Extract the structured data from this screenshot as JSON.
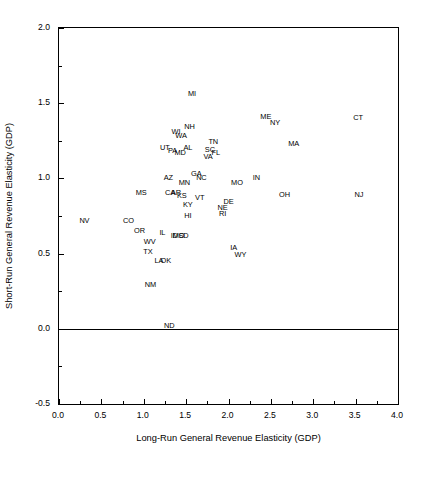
{
  "chart_data": {
    "type": "scatter",
    "title": "",
    "xlabel": "Long-Run General Revenue Elasticity (GDP)",
    "ylabel": "Short-Run General Revenue Elasticity (GDP)",
    "xlim": [
      0.0,
      4.0
    ],
    "ylim": [
      -0.5,
      2.0
    ],
    "xticks": [
      "0.0",
      "0.5",
      "1.0",
      "1.5",
      "2.0",
      "2.5",
      "3.0",
      "3.5",
      "4.0"
    ],
    "xtick_values": [
      0.0,
      0.5,
      1.0,
      1.5,
      2.0,
      2.5,
      3.0,
      3.5,
      4.0
    ],
    "yticks": [
      "-0.5",
      "0.0",
      "0.5",
      "1.0",
      "1.5",
      "2.0"
    ],
    "ytick_values": [
      -0.5,
      0.0,
      0.5,
      1.0,
      1.5,
      2.0
    ],
    "xminor_step": 0.25,
    "yminor_step": 0.25,
    "grid": false,
    "legend": false,
    "marker_style": "text-label",
    "zero_line_y": 0.0,
    "points": [
      {
        "label": "MI",
        "x": 1.57,
        "y": 1.56
      },
      {
        "label": "CT",
        "x": 3.53,
        "y": 1.4
      },
      {
        "label": "ME",
        "x": 2.44,
        "y": 1.41
      },
      {
        "label": "NY",
        "x": 2.55,
        "y": 1.37
      },
      {
        "label": "NH",
        "x": 1.54,
        "y": 1.34
      },
      {
        "label": "WI",
        "x": 1.38,
        "y": 1.31
      },
      {
        "label": "WA",
        "x": 1.44,
        "y": 1.28
      },
      {
        "label": "TN",
        "x": 1.82,
        "y": 1.24
      },
      {
        "label": "MA",
        "x": 2.77,
        "y": 1.23
      },
      {
        "label": "UT",
        "x": 1.25,
        "y": 1.2
      },
      {
        "label": "AL",
        "x": 1.52,
        "y": 1.2
      },
      {
        "label": "SC",
        "x": 1.78,
        "y": 1.19
      },
      {
        "label": "PA",
        "x": 1.34,
        "y": 1.18
      },
      {
        "label": "MD",
        "x": 1.43,
        "y": 1.17
      },
      {
        "label": "FL",
        "x": 1.85,
        "y": 1.17
      },
      {
        "label": "VA",
        "x": 1.76,
        "y": 1.14
      },
      {
        "label": "GA",
        "x": 1.62,
        "y": 1.03
      },
      {
        "label": "NC",
        "x": 1.68,
        "y": 1.0
      },
      {
        "label": "AZ",
        "x": 1.29,
        "y": 1.0
      },
      {
        "label": "IN",
        "x": 2.33,
        "y": 1.0
      },
      {
        "label": "MN",
        "x": 1.48,
        "y": 0.97
      },
      {
        "label": "MO",
        "x": 2.1,
        "y": 0.97
      },
      {
        "label": "MS",
        "x": 0.97,
        "y": 0.9
      },
      {
        "label": "CA",
        "x": 1.31,
        "y": 0.9
      },
      {
        "label": "AR",
        "x": 1.38,
        "y": 0.9
      },
      {
        "label": "KS",
        "x": 1.45,
        "y": 0.88
      },
      {
        "label": "OH",
        "x": 2.66,
        "y": 0.89
      },
      {
        "label": "NJ",
        "x": 3.54,
        "y": 0.89
      },
      {
        "label": "VT",
        "x": 1.66,
        "y": 0.87
      },
      {
        "label": "DE",
        "x": 2.0,
        "y": 0.84
      },
      {
        "label": "KY",
        "x": 1.52,
        "y": 0.82
      },
      {
        "label": "NE",
        "x": 1.93,
        "y": 0.8
      },
      {
        "label": "NV",
        "x": 0.3,
        "y": 0.72
      },
      {
        "label": "CO",
        "x": 0.82,
        "y": 0.72
      },
      {
        "label": "HI",
        "x": 1.52,
        "y": 0.75
      },
      {
        "label": "RI",
        "x": 1.93,
        "y": 0.76
      },
      {
        "label": "OR",
        "x": 0.95,
        "y": 0.65
      },
      {
        "label": "IL",
        "x": 1.22,
        "y": 0.64
      },
      {
        "label": "ID",
        "x": 1.36,
        "y": 0.62
      },
      {
        "label": "MO2",
        "x": 1.41,
        "y": 0.62
      },
      {
        "label": "SD",
        "x": 1.47,
        "y": 0.62
      },
      {
        "label": "WV",
        "x": 1.07,
        "y": 0.58
      },
      {
        "label": "IA",
        "x": 2.06,
        "y": 0.54
      },
      {
        "label": "TX",
        "x": 1.05,
        "y": 0.51
      },
      {
        "label": "WY",
        "x": 2.14,
        "y": 0.49
      },
      {
        "label": "LA",
        "x": 1.18,
        "y": 0.45
      },
      {
        "label": "OK",
        "x": 1.26,
        "y": 0.45
      },
      {
        "label": "NM",
        "x": 1.08,
        "y": 0.29
      },
      {
        "label": "ND",
        "x": 1.3,
        "y": 0.02
      }
    ]
  },
  "axes": {
    "x_title": "Long-Run General Revenue Elasticity (GDP)",
    "y_title": "Short-Run General Revenue Elasticity (GDP)"
  }
}
